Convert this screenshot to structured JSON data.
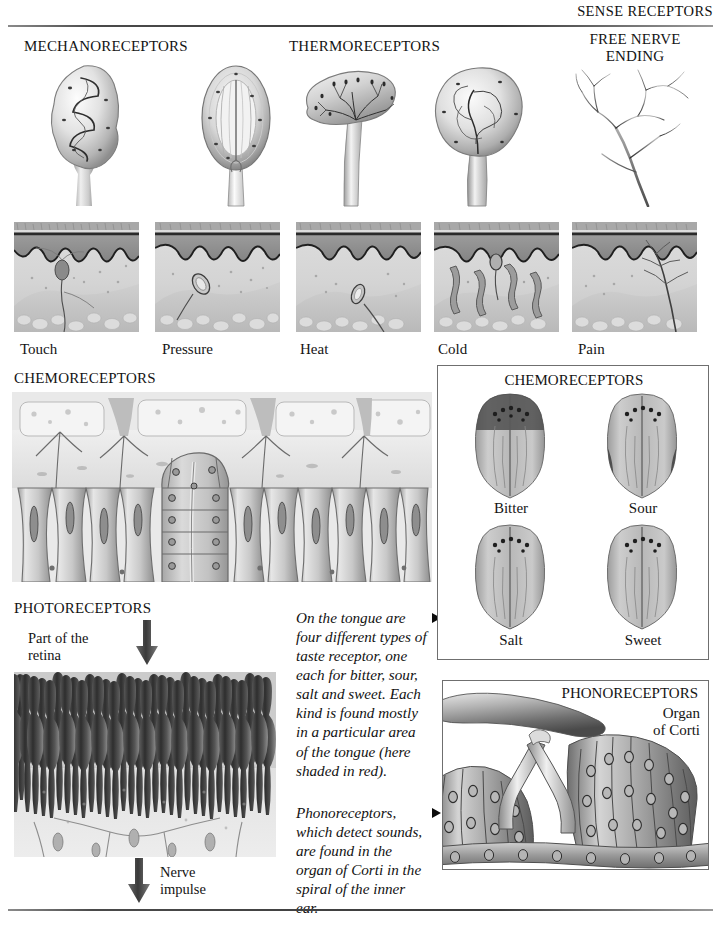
{
  "page": {
    "header_title": "SENSE RECEPTORS"
  },
  "sections": {
    "mechanoreceptors": {
      "heading": "MECHANORECEPTORS"
    },
    "thermoreceptors": {
      "heading": "THERMORECEPTORS"
    },
    "free_nerve_ending": {
      "heading_line1": "FREE NERVE",
      "heading_line2": "ENDING"
    },
    "chemoreceptors": {
      "heading": "CHEMORECEPTORS"
    },
    "photoreceptors": {
      "heading": "PHOTORECEPTORS"
    }
  },
  "skin_sections": {
    "labels": [
      "Touch",
      "Pressure",
      "Heat",
      "Cold",
      "Pain"
    ]
  },
  "photoreceptors": {
    "retina_label_line1": "Part of the",
    "retina_label_line2": "retina",
    "impulse_label_line1": "Nerve",
    "impulse_label_line2": "impulse"
  },
  "tongue_panel": {
    "title": "CHEMORECEPTORS",
    "tastes": [
      {
        "label": "Bitter",
        "region": "back"
      },
      {
        "label": "Sour",
        "region": "sides"
      },
      {
        "label": "Salt",
        "region": "tip-edges"
      },
      {
        "label": "Sweet",
        "region": "tip"
      }
    ]
  },
  "ear_panel": {
    "title": "PHONORECEPTORS",
    "sublabel_line1": "Organ",
    "sublabel_line2": "of Corti"
  },
  "captions": [
    {
      "bullet": "triangle-right",
      "text": "On the tongue are four different types of taste receptor, one each for bitter, sour,  salt and sweet. Each kind is found mostly in a particular area of the tongue (here shaded in red)."
    },
    {
      "bullet": "triangle-right",
      "text": "Phonoreceptors, which detect sounds, are found in the organ of Corti in the spiral of the inner ear."
    }
  ],
  "colors": {
    "ink": "#141414",
    "rule": "#4a4a4a",
    "panel_border": "#6f6f6f",
    "epidermis": "#8d8d8d",
    "dermis": "#cfcfcf",
    "tissue_light": "#e6e6e6"
  }
}
